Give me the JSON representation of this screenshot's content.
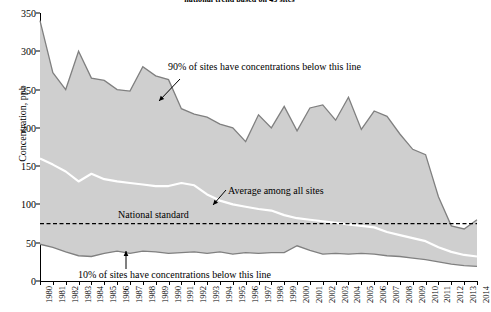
{
  "chart_data": {
    "type": "area",
    "title": "national trend based on 43 sites",
    "xlabel": "",
    "ylabel": "Concentration, ppb",
    "ylim": [
      0,
      350
    ],
    "ytick_step": 50,
    "yticks": [
      0,
      50,
      100,
      150,
      200,
      250,
      300,
      350
    ],
    "grid": false,
    "legend": "none",
    "x": [
      1980,
      1981,
      1982,
      1983,
      1984,
      1985,
      1986,
      1987,
      1988,
      1989,
      1990,
      1991,
      1992,
      1993,
      1994,
      1995,
      1996,
      1997,
      1998,
      1999,
      2000,
      2001,
      2002,
      2003,
      2004,
      2005,
      2006,
      2007,
      2008,
      2009,
      2010,
      2011,
      2012,
      2013,
      2014
    ],
    "categories": [
      "1980",
      "1981",
      "1982",
      "1983",
      "1984",
      "1985",
      "1986",
      "1987",
      "1988",
      "1989",
      "1990",
      "1991",
      "1992",
      "1993",
      "1994",
      "1995",
      "1996",
      "1997",
      "1998",
      "1999",
      "2000",
      "2001",
      "2002",
      "2003",
      "2004",
      "2005",
      "2006",
      "2007",
      "2008",
      "2009",
      "2010",
      "2011",
      "2012",
      "2013",
      "2014"
    ],
    "series": [
      {
        "name": "90% of sites have concentrations below this line",
        "key": "p90",
        "values": [
          340,
          272,
          250,
          300,
          265,
          262,
          250,
          248,
          280,
          268,
          263,
          225,
          218,
          214,
          205,
          200,
          182,
          217,
          200,
          228,
          196,
          226,
          230,
          210,
          240,
          198,
          222,
          215,
          192,
          172,
          165,
          110,
          72,
          68,
          80
        ]
      },
      {
        "name": "Average among all sites",
        "key": "avg",
        "values": [
          160,
          152,
          143,
          130,
          140,
          133,
          130,
          128,
          126,
          124,
          124,
          128,
          125,
          113,
          105,
          100,
          97,
          94,
          92,
          86,
          82,
          80,
          78,
          76,
          74,
          72,
          70,
          64,
          60,
          56,
          52,
          44,
          38,
          34,
          32
        ]
      },
      {
        "name": "10% of sites have concentrations below this line",
        "key": "p10",
        "values": [
          48,
          44,
          38,
          33,
          32,
          36,
          39,
          36,
          39,
          38,
          36,
          37,
          38,
          36,
          38,
          35,
          37,
          36,
          37,
          37,
          46,
          40,
          35,
          36,
          35,
          36,
          35,
          33,
          32,
          30,
          28,
          25,
          22,
          20,
          19
        ]
      }
    ],
    "reference_line": {
      "label": "National standard",
      "value": 75,
      "style": "dashed"
    },
    "annotations": [
      {
        "key": "p90",
        "text": "90% of sites have concentrations below this line"
      },
      {
        "key": "avg",
        "text": "Average among all sites"
      },
      {
        "key": "std",
        "text": "National standard"
      },
      {
        "key": "p10",
        "text": "10% of sites have concentrations below this line"
      }
    ],
    "colors": {
      "band_fill": "#cfcfcf",
      "band_edge": "#808080",
      "average_line": "#ffffff",
      "reference_line": "#000000",
      "axis": "#000000"
    }
  }
}
